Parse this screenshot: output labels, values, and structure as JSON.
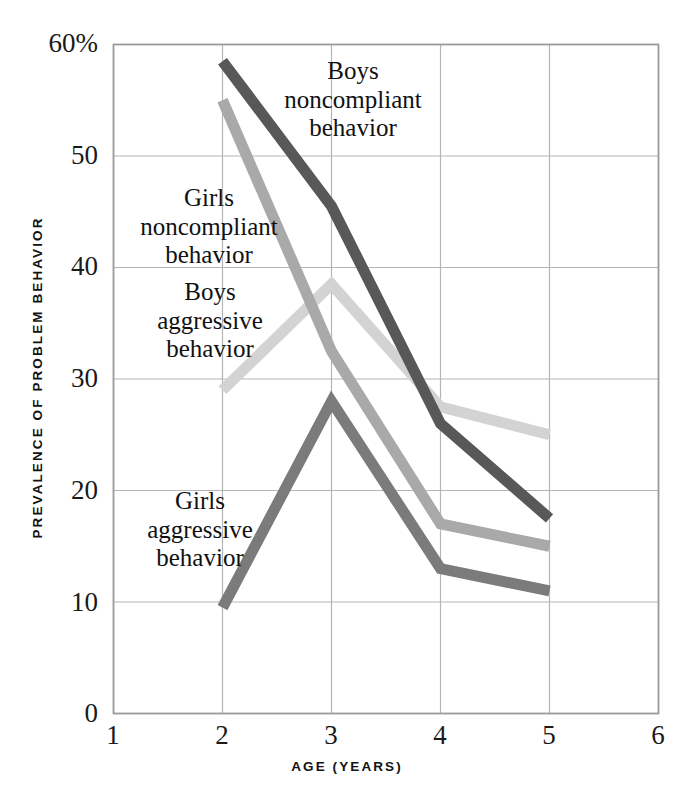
{
  "chart_data": {
    "type": "line",
    "title": "",
    "xlabel": "AGE (YEARS)",
    "ylabel": "PREVALENCE OF PROBLEM BEHAVIOR",
    "xlim": [
      1,
      6
    ],
    "ylim": [
      0,
      60
    ],
    "grid": true,
    "legend_position": "inline-annotations",
    "x": [
      2,
      3,
      4,
      5
    ],
    "xticks": [
      "1",
      "2",
      "3",
      "4",
      "5",
      "6"
    ],
    "xtick_values": [
      1,
      2,
      3,
      4,
      5,
      6
    ],
    "yticks": [
      "0",
      "10",
      "20",
      "30",
      "40",
      "50",
      "60%"
    ],
    "ytick_values": [
      0,
      10,
      20,
      30,
      40,
      50,
      60
    ],
    "series": [
      {
        "name": "Boys noncompliant behavior",
        "label_lines": [
          "Boys",
          "noncompliant",
          "behavior"
        ],
        "color": "#585858",
        "values": [
          58.5,
          45.5,
          26.0,
          17.5
        ]
      },
      {
        "name": "Girls noncompliant behavior",
        "label_lines": [
          "Girls",
          "noncompliant",
          "behavior"
        ],
        "color": "#a9a9a9",
        "values": [
          55.0,
          32.5,
          17.0,
          15.0
        ]
      },
      {
        "name": "Boys aggressive behavior",
        "label_lines": [
          "Boys",
          "aggressive",
          "behavior"
        ],
        "color": "#d3d3d3",
        "values": [
          29.0,
          38.5,
          27.5,
          25.0
        ]
      },
      {
        "name": "Girls aggressive behavior",
        "label_lines": [
          "Girls",
          "aggressive",
          "behavior"
        ],
        "color": "#7b7b7b",
        "values": [
          9.5,
          28.0,
          13.0,
          11.0
        ]
      }
    ]
  },
  "axes": {
    "y_title": "PREVALENCE OF PROBLEM BEHAVIOR",
    "x_title": "AGE (YEARS)",
    "ytick_0": "0",
    "ytick_10": "10",
    "ytick_20": "20",
    "ytick_30": "30",
    "ytick_40": "40",
    "ytick_50": "50",
    "ytick_60": "60%",
    "xtick_1": "1",
    "xtick_2": "2",
    "xtick_3": "3",
    "xtick_4": "4",
    "xtick_5": "5",
    "xtick_6": "6"
  },
  "annotations": {
    "boys_noncompliant": {
      "line1": "Boys",
      "line2": "noncompliant",
      "line3": "behavior"
    },
    "girls_noncompliant": {
      "line1": "Girls",
      "line2": "noncompliant",
      "line3": "behavior"
    },
    "boys_aggressive": {
      "line1": "Boys",
      "line2": "aggressive",
      "line3": "behavior"
    },
    "girls_aggressive": {
      "line1": "Girls",
      "line2": "aggressive",
      "line3": "behavior"
    }
  },
  "colors": {
    "frame": "#9a9a9a",
    "grid": "#b5b5b5",
    "boys_noncompliant": "#585858",
    "girls_noncompliant": "#a9a9a9",
    "boys_aggressive": "#d3d3d3",
    "girls_aggressive": "#7b7b7b",
    "background": "#ffffff"
  }
}
